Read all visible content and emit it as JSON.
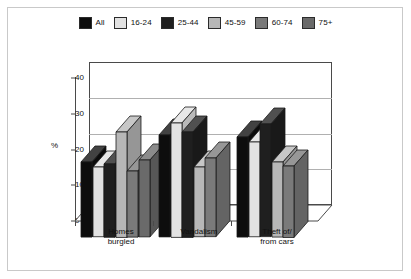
{
  "chart_data": {
    "type": "bar",
    "title": "",
    "subtitle": "",
    "xlabel": "",
    "ylabel": "%",
    "ylim": [
      0,
      40
    ],
    "yticks": [
      0,
      10,
      20,
      30,
      40
    ],
    "ytick_labels": [
      "0",
      "10",
      "20",
      "30",
      "40"
    ],
    "grid": true,
    "grid_axis": "y",
    "legend_position": "top-center",
    "three_d": true,
    "categories": [
      "Homes\nburgled",
      "Vandalism",
      "Theft of/\nfrom cars"
    ],
    "category_labels": [
      "Homes burgled",
      "Vandalism",
      "Theft of/ from cars"
    ],
    "series": [
      {
        "name": "All",
        "color": "#0d0d0d",
        "values": [
          21.0,
          28.5,
          28.0
        ]
      },
      {
        "name": "16-24",
        "color": "#e2e2e2",
        "values": [
          19.5,
          32.0,
          26.5
        ]
      },
      {
        "name": "25-44",
        "color": "#1f1f1f",
        "values": [
          20.5,
          29.5,
          31.5
        ]
      },
      {
        "name": "45-59",
        "color": "#b7b7b7",
        "values": [
          29.5,
          19.5,
          21.0
        ]
      },
      {
        "name": "60-74",
        "color": "#7a7a7a",
        "values": [
          18.5,
          22.0,
          20.0
        ]
      },
      {
        "name": "75+",
        "color": "#6a6a6a",
        "values": [
          21.5,
          0.0,
          0.0
        ]
      }
    ]
  },
  "legend": {
    "items": [
      {
        "label": "All",
        "color": "#0d0d0d"
      },
      {
        "label": "16-24",
        "color": "#e2e2e2"
      },
      {
        "label": "25-44",
        "color": "#1f1f1f"
      },
      {
        "label": "45-59",
        "color": "#b7b7b7"
      },
      {
        "label": "60-74",
        "color": "#7a7a7a"
      },
      {
        "label": "75+",
        "color": "#6a6a6a"
      }
    ]
  },
  "axes": {
    "y_axis_label": "%",
    "y_tick_labels": [
      "40",
      "30",
      "20",
      "10",
      "0"
    ],
    "x_tick_labels": [
      "Homes\nburgled",
      "Vandalism",
      "Theft of/\nfrom cars"
    ]
  },
  "colors": {
    "background": "#ffffff",
    "frame_border": "#c9c9c9",
    "axis": "#4a4a4a",
    "gridline": "#b0b0b0",
    "bar_outline": "#1a1a1a",
    "text": "#111111"
  }
}
